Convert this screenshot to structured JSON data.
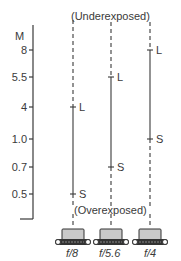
{
  "diagram": {
    "axis": {
      "unit_label": "M",
      "ticks": [
        {
          "label": "8",
          "y": 50
        },
        {
          "label": "5.5",
          "y": 77
        },
        {
          "label": "4",
          "y": 107
        },
        {
          "label": "1.0",
          "y": 139
        },
        {
          "label": "0.7",
          "y": 167
        },
        {
          "label": "0.5",
          "y": 194
        }
      ]
    },
    "top_label": "(Underexposed)",
    "bottom_label": "(Overexposed)",
    "columns": [
      {
        "aperture": "f/8",
        "long_marker": "L",
        "short_marker": "S",
        "long_value": "4",
        "short_value": "0.5"
      },
      {
        "aperture": "f/5.6",
        "long_marker": "L",
        "short_marker": "S",
        "long_value": "5.5",
        "short_value": "0.7"
      },
      {
        "aperture": "f/4",
        "long_marker": "L",
        "short_marker": "S",
        "long_value": "8",
        "short_value": "1.0"
      }
    ],
    "colors": {
      "line": "#3a3a3a",
      "flash_body": "#c9c9c9",
      "background": "#ffffff"
    }
  }
}
